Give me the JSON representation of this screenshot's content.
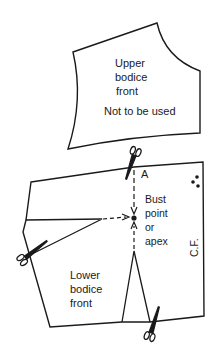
{
  "diagram": {
    "upper_piece": {
      "title_lines": [
        "Upper",
        "bodice",
        "front"
      ],
      "note": "Not to be used"
    },
    "lower_piece": {
      "title_lines": [
        "Lower",
        "bodice",
        "front"
      ],
      "point_label": "A",
      "bust_lines": [
        "Bust",
        "point",
        "or",
        "apex"
      ],
      "centre_front_label": "C.F."
    },
    "icons": [
      "scissors-icon",
      "scissors-icon",
      "scissors-icon",
      "fold-dots-icon"
    ],
    "colors": {
      "line": "#1a1a1a",
      "background": "#ffffff"
    }
  }
}
